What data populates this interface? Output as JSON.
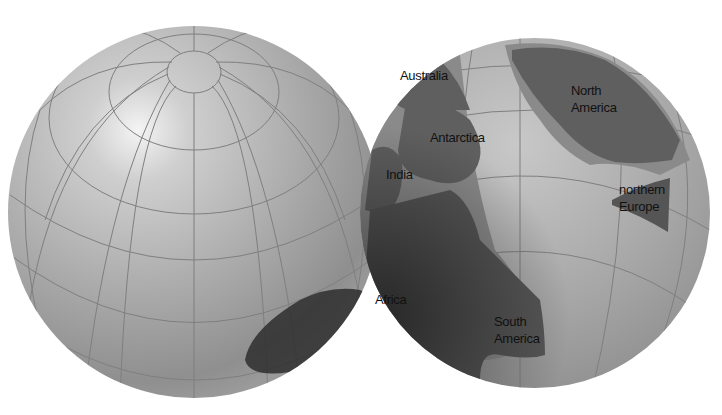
{
  "figure": {
    "colors": {
      "background": "#ffffff",
      "globe_light": "#d2d2d2",
      "globe_mid": "#a9a9a9",
      "globe_dark": "#6e6e6e",
      "grid_line": "#7f7f7f",
      "land": "#5f5f5f",
      "shelf": "#8a8a8a",
      "label": "#111111"
    }
  },
  "left_globe": {
    "name": "northern-hemisphere-globe",
    "grid": "north polar graticule"
  },
  "right_globe": {
    "name": "southern-hemisphere-globe",
    "labels": [
      {
        "id": "australia",
        "text": "Australia"
      },
      {
        "id": "antarctica",
        "text": "Antarctica"
      },
      {
        "id": "india",
        "text": "India"
      },
      {
        "id": "north-america-1",
        "text": "North"
      },
      {
        "id": "north-america-2",
        "text": "America"
      },
      {
        "id": "northern-europe-1",
        "text": "northern"
      },
      {
        "id": "northern-europe-2",
        "text": "Europe"
      },
      {
        "id": "africa",
        "text": "Africa"
      },
      {
        "id": "south-america-1",
        "text": "South"
      },
      {
        "id": "south-america-2",
        "text": "America"
      }
    ]
  }
}
